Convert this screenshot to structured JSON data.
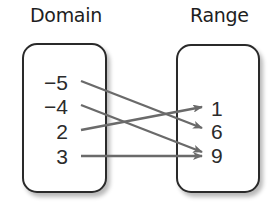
{
  "diagram": {
    "domain_label": "Domain",
    "range_label": "Range",
    "domain": [
      "−5",
      "−4",
      "2",
      "3"
    ],
    "range": [
      "1",
      "6",
      "9"
    ],
    "mappings": [
      {
        "from": "−5",
        "to": "6"
      },
      {
        "from": "−4",
        "to": "9"
      },
      {
        "from": "2",
        "to": "1"
      },
      {
        "from": "3",
        "to": "9"
      }
    ],
    "colors": {
      "arrow": "#6a6a6a",
      "box_border": "#2a2a2a",
      "text": "#2b2b2b"
    }
  }
}
